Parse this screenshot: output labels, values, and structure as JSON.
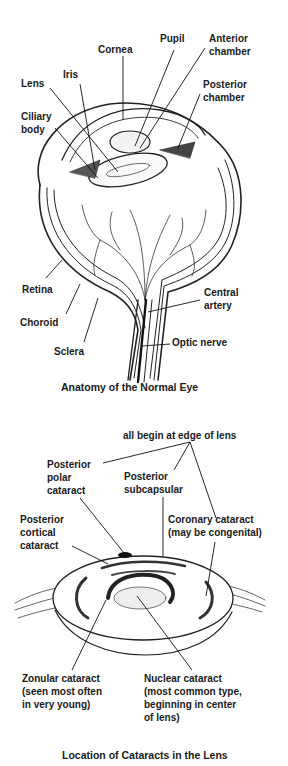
{
  "figure1": {
    "caption": "Anatomy of the Normal Eye",
    "labels": {
      "cornea": "Cornea",
      "pupil": "Pupil",
      "anterior_chamber": "Anterior\nchamber",
      "iris": "Iris",
      "lens": "Lens",
      "posterior_chamber": "Posterior\nchamber",
      "ciliary_body": "Ciliary\nbody",
      "retina": "Retina",
      "choroid": "Choroid",
      "sclera": "Sclera",
      "central_artery": "Central\nartery",
      "optic_nerve": "Optic nerve"
    }
  },
  "figure2": {
    "caption": "Location of Cataracts in the Lens",
    "labels": {
      "edge_note": "all begin at edge of lens",
      "posterior_polar": "Posterior\npolar\ncataract",
      "posterior_subcapsular": "Posterior\nsubcapsular",
      "posterior_cortical": "Posterior\ncortical\ncataract",
      "coronary": "Coronary cataract\n(may be congenital)",
      "zonular": "Zonular cataract\n(seen most often\nin very young)",
      "nuclear": "Nuclear cataract\n(most common type,\nbeginning in center\nof lens)"
    }
  }
}
